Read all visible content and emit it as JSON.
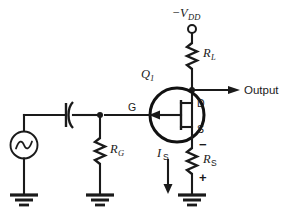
{
  "figure": {
    "background_color": "#ffffff",
    "line_color": "#1a1a1a"
  },
  "labels": {
    "supply": {
      "sign": "−",
      "symbol": "V",
      "subscript": "DD",
      "full": "−VDD"
    },
    "load_resistor": {
      "symbol": "R",
      "subscript": "L",
      "full": "RL"
    },
    "gate_resistor": {
      "symbol": "R",
      "subscript": "G",
      "full": "RG"
    },
    "source_resistor": {
      "symbol": "R",
      "subscript": "S",
      "full": "RS"
    },
    "transistor": {
      "symbol": "Q",
      "subscript": "1",
      "full": "Q1"
    },
    "source_current": {
      "symbol": "I",
      "subscript": "S",
      "full": "IS"
    },
    "terminal_gate": "G",
    "terminal_drain": "D",
    "terminal_source": "S",
    "output": "Output",
    "polarity_minus": "−",
    "polarity_plus": "+"
  },
  "components": [
    {
      "name": "supply-terminal",
      "type": "terminal",
      "label": "−VDD"
    },
    {
      "name": "load-resistor",
      "type": "resistor",
      "label": "RL"
    },
    {
      "name": "jfet-transistor",
      "type": "jfet-n-channel",
      "label": "Q1"
    },
    {
      "name": "gate-resistor",
      "type": "resistor",
      "label": "RG"
    },
    {
      "name": "source-resistor",
      "type": "resistor",
      "label": "RS"
    },
    {
      "name": "coupling-capacitor",
      "type": "capacitor-polarized",
      "label": ""
    },
    {
      "name": "ac-source",
      "type": "ac-voltage-source",
      "label": ""
    },
    {
      "name": "ground-source",
      "type": "ground",
      "label": ""
    },
    {
      "name": "ground-gate",
      "type": "ground",
      "label": ""
    },
    {
      "name": "ground-emitter",
      "type": "ground",
      "label": ""
    },
    {
      "name": "output-arrow",
      "type": "arrow",
      "label": "Output"
    },
    {
      "name": "current-arrow",
      "type": "arrow",
      "label": "IS"
    }
  ]
}
